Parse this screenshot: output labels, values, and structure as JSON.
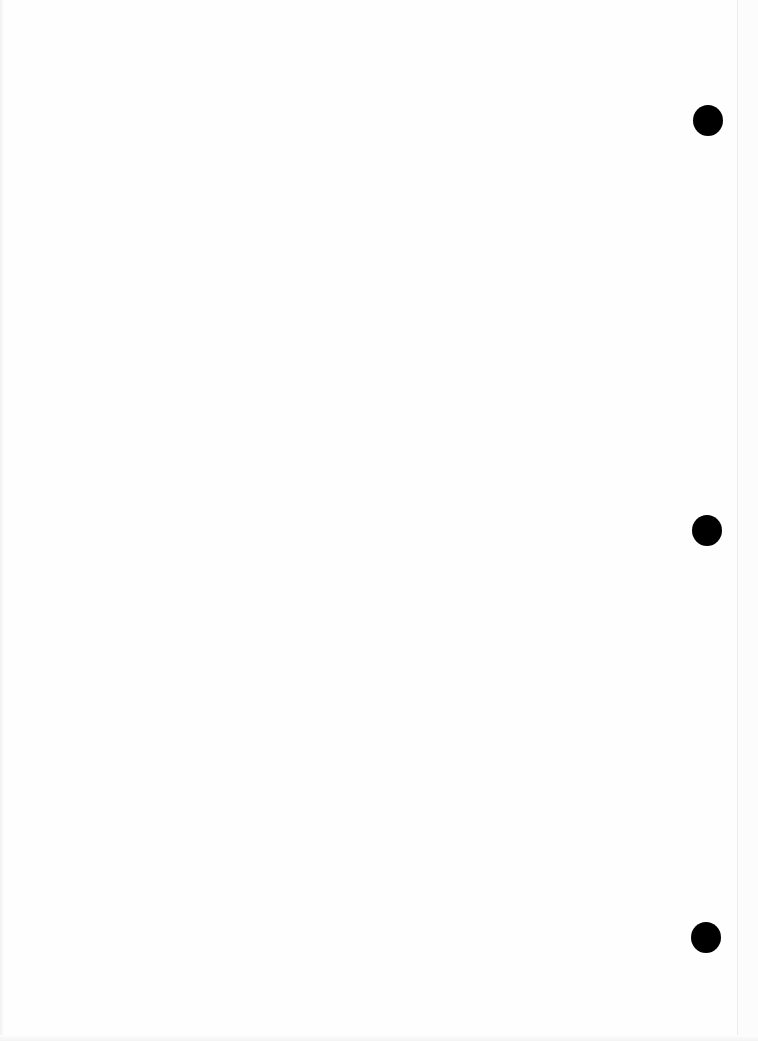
{
  "document": {
    "type": "blank-scanned-page",
    "text": "",
    "punch_holes": [
      {
        "id": "top",
        "left": 693,
        "top": 105
      },
      {
        "id": "middle",
        "left": 692,
        "top": 515
      },
      {
        "id": "bottom",
        "left": 691,
        "top": 922
      }
    ],
    "colors": {
      "paper": "#fefefe",
      "hole": "#000000",
      "edge": "#ececec"
    }
  }
}
